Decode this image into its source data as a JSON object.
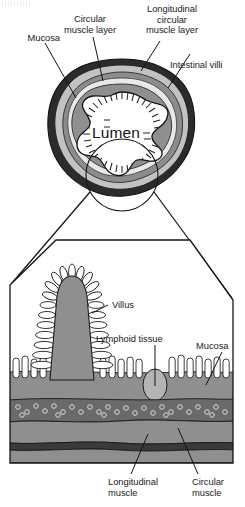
{
  "figure": {
    "type": "anatomical-diagram"
  },
  "palette": {
    "outline": "#1a1a1a",
    "serosa_dark": "#2b2b2b",
    "muscle_mid": "#8c8c8c",
    "muscle_light": "#b9b9b9",
    "mucosa_grey": "#8f8f8f",
    "submucosa_dark": "#6a6a6a",
    "lymphoid_light": "#b2b2b2",
    "lumen_white": "#ffffff",
    "background": "#ffffff",
    "label_text": "#1b1b1b"
  },
  "cross_section": {
    "lumen_label": "Lumen",
    "labels": [
      {
        "id": "mucosa-top",
        "text": "Mucosa"
      },
      {
        "id": "circular-muscle",
        "text": "Circular\nmuscle layer"
      },
      {
        "id": "longitudinal-circular-muscle",
        "text": "Longitudinal\ncircular\nmuscle layer"
      },
      {
        "id": "intestinal-villi",
        "text": "Intestinal villi"
      }
    ]
  },
  "detail_panel": {
    "labels": [
      {
        "id": "villus",
        "text": "Villus"
      },
      {
        "id": "lymphoid-tissue",
        "text": "Lymphoid tissue"
      },
      {
        "id": "mucosa-detail",
        "text": "Mucosa"
      },
      {
        "id": "longitudinal-muscle",
        "text": "Longitudinal\nmuscle"
      },
      {
        "id": "circular-muscle-detail",
        "text": "Circular\nmuscle"
      }
    ]
  }
}
